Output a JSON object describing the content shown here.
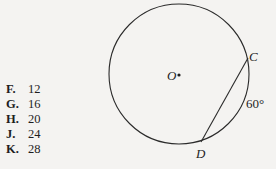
{
  "answer_choices": [
    {
      "letter": "F.",
      "value": "12"
    },
    {
      "letter": "G.",
      "value": "16"
    },
    {
      "letter": "H.",
      "value": "20"
    },
    {
      "letter": "J.",
      "value": "24"
    },
    {
      "letter": "K.",
      "value": "28"
    }
  ],
  "figure": {
    "circle": {
      "cx": 179,
      "cy": 74,
      "r": 70
    },
    "center_label": "O",
    "points": {
      "C": {
        "label": "C",
        "x": 248,
        "y": 58
      },
      "D": {
        "label": "D",
        "x": 201,
        "y": 142
      }
    },
    "arc_label": "60°",
    "colors": {
      "stroke": "#2a2a2a",
      "background": "#f4f3f1"
    }
  }
}
